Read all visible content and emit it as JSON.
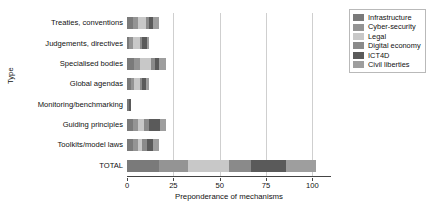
{
  "chart_data": {
    "type": "bar",
    "orientation": "horizontal",
    "stacked": true,
    "title": "",
    "xlabel": "Preponderance of mechanisms",
    "ylabel": "Type",
    "xlim": [
      0,
      110
    ],
    "xticks": [
      0,
      25,
      50,
      75,
      100
    ],
    "xtick_labels": [
      "0",
      "25",
      "50",
      "75",
      "100"
    ],
    "grid": "vertical gridlines at x ticks",
    "legend_position": "upper right, outside plot",
    "categories": [
      "Treaties, conventions",
      "Judgements, directives",
      "Specialised bodies",
      "Global agendas",
      "Monitoring/benchmarking",
      "Guiding principles",
      "Toolkits/model laws",
      "TOTAL"
    ],
    "series": [
      {
        "name": "Infrastructure",
        "color": "#7a7a7a",
        "values": [
          3,
          1,
          4,
          2,
          1,
          3,
          3,
          17
        ]
      },
      {
        "name": "Cyber-security",
        "color": "#949494",
        "values": [
          3,
          2,
          3,
          2,
          0,
          3,
          3,
          16
        ]
      },
      {
        "name": "Legal",
        "color": "#c8c8c8",
        "values": [
          4,
          4,
          6,
          3,
          0,
          3,
          2,
          22
        ]
      },
      {
        "name": "Digital economy",
        "color": "#8a8a8a",
        "values": [
          2,
          1,
          2,
          1,
          0,
          3,
          3,
          12
        ]
      },
      {
        "name": "ICT4D",
        "color": "#5a5a5a",
        "values": [
          2,
          3,
          2,
          2,
          1,
          6,
          3,
          19
        ]
      },
      {
        "name": "Civil liberties",
        "color": "#9e9e9e",
        "values": [
          3,
          1,
          4,
          2,
          0,
          3,
          3,
          16
        ]
      }
    ],
    "totals": [
      17,
      12,
      21,
      12,
      2,
      21,
      17,
      102
    ]
  },
  "axis": {
    "y_title": "Type",
    "x_title": "Preponderance of mechanisms"
  },
  "legend": {
    "items": [
      {
        "label": "Infrastructure"
      },
      {
        "label": "Cyber-security"
      },
      {
        "label": "Legal"
      },
      {
        "label": "Digital economy"
      },
      {
        "label": "ICT4D"
      },
      {
        "label": "Civil liberties"
      }
    ]
  }
}
